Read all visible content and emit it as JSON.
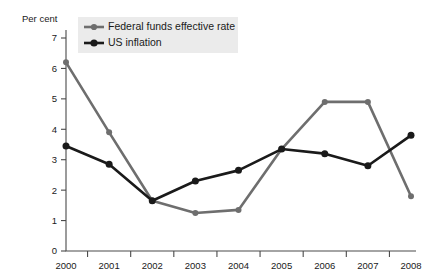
{
  "chart_data": {
    "type": "line",
    "title": "",
    "xlabel": "",
    "ylabel": "Per cent",
    "x": [
      "2000",
      "2001",
      "2002",
      "2003",
      "2004",
      "2005",
      "2006",
      "2007",
      "2008"
    ],
    "xlim": [
      2000,
      2008
    ],
    "ylim": [
      0,
      7
    ],
    "yticks": [
      "0",
      "1",
      "2",
      "3",
      "4",
      "5",
      "6",
      "7"
    ],
    "grid": false,
    "legend_position": "top-left",
    "series": [
      {
        "name": "Federal funds effective rate",
        "color": "#6e6e6e",
        "marker": "circle",
        "values": [
          6.2,
          3.9,
          1.65,
          1.25,
          1.35,
          3.35,
          4.9,
          4.9,
          1.8
        ]
      },
      {
        "name": "US inflation",
        "color": "#1a1a1a",
        "marker": "circle",
        "values": [
          3.45,
          2.85,
          1.65,
          2.3,
          2.65,
          3.35,
          3.2,
          2.8,
          3.8
        ]
      }
    ]
  },
  "axes": {
    "y_axis_title": "Per cent",
    "y_tick_labels": [
      "7",
      "6",
      "5",
      "4",
      "3",
      "2",
      "1",
      "0"
    ],
    "x_tick_labels": [
      "2000",
      "2001",
      "2002",
      "2003",
      "2004",
      "2005",
      "2006",
      "2007",
      "2008"
    ]
  },
  "legend": {
    "entries": [
      {
        "label": "Federal funds effective rate",
        "color": "#6e6e6e"
      },
      {
        "label": "US inflation",
        "color": "#1a1a1a"
      }
    ]
  },
  "colors": {
    "federal_funds": "#6e6e6e",
    "us_inflation": "#1a1a1a",
    "axis": "#4a4a4a",
    "legend_background": "#ebebeb",
    "background": "#ffffff"
  }
}
